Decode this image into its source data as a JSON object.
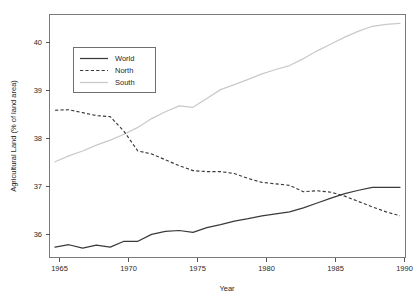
{
  "chart_data": {
    "type": "line",
    "title": "",
    "xlabel": "Year",
    "ylabel": "Agricultural Land (% of land area)",
    "xlim": [
      1964.6,
      1990.4
    ],
    "ylim": [
      35.55,
      40.5
    ],
    "xticks": [
      1965,
      1970,
      1975,
      1980,
      1985,
      1990
    ],
    "yticks": [
      36,
      37,
      38,
      39,
      40
    ],
    "xtick_labels": [
      "1965",
      "1970",
      "1975",
      "1980",
      "1985",
      "1990"
    ],
    "ytick_labels": [
      "36",
      "37",
      "38",
      "39",
      "40"
    ],
    "grid": false,
    "legend_position": "top-left",
    "x": [
      1965,
      1966,
      1967,
      1968,
      1969,
      1970,
      1971,
      1972,
      1973,
      1974,
      1975,
      1976,
      1977,
      1978,
      1979,
      1980,
      1981,
      1982,
      1983,
      1984,
      1985,
      1986,
      1987,
      1988,
      1989,
      1990
    ],
    "series": [
      {
        "name": "World",
        "style": "solid",
        "color": "#3a3a3a",
        "values": [
          35.76,
          35.81,
          35.74,
          35.8,
          35.76,
          35.88,
          35.88,
          36.02,
          36.08,
          36.1,
          36.06,
          36.16,
          36.22,
          36.29,
          36.34,
          36.4,
          36.44,
          36.48,
          36.56,
          36.66,
          36.76,
          36.85,
          36.92,
          36.98,
          36.98,
          36.98
        ]
      },
      {
        "name": "North",
        "style": "dashed",
        "color": "#3a3a3a",
        "values": [
          38.55,
          38.56,
          38.5,
          38.44,
          38.42,
          38.12,
          37.72,
          37.66,
          37.54,
          37.42,
          37.32,
          37.3,
          37.3,
          37.26,
          37.16,
          37.08,
          37.05,
          37.02,
          36.89,
          36.91,
          36.88,
          36.8,
          36.69,
          36.58,
          36.48,
          36.4
        ]
      },
      {
        "name": "South",
        "style": "solid-light",
        "color": "#c9c9c9",
        "values": [
          37.5,
          37.62,
          37.72,
          37.84,
          37.94,
          38.06,
          38.2,
          38.38,
          38.52,
          38.64,
          38.61,
          38.79,
          38.97,
          39.07,
          39.18,
          39.29,
          39.38,
          39.46,
          39.6,
          39.76,
          39.9,
          40.04,
          40.16,
          40.26,
          40.3,
          40.32
        ]
      }
    ],
    "legend_entries": [
      "World",
      "North",
      "South"
    ]
  },
  "legend": {
    "items": [
      {
        "label": "World"
      },
      {
        "label": "North"
      },
      {
        "label": "South"
      }
    ]
  },
  "axes": {
    "x_title": "Year",
    "y_title": "Agricultural Land (% of land area)",
    "x_tick_labels": [
      "1965",
      "1970",
      "1975",
      "1980",
      "1985",
      "1990"
    ],
    "y_tick_labels": [
      "36",
      "37",
      "38",
      "39",
      "40"
    ]
  }
}
